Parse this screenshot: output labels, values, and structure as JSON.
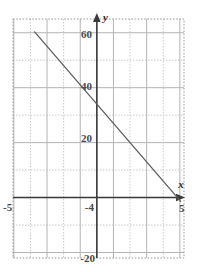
{
  "chart_data": {
    "type": "line",
    "title": "",
    "xlabel": "x",
    "ylabel": "y",
    "xlim": [
      -5.05,
      5.25
    ],
    "ylim": [
      -22,
      65
    ],
    "grid": true,
    "legend": null,
    "x_ticks": [
      {
        "value": -5,
        "label": "-5"
      },
      {
        "value": 4,
        "label": "-4"
      },
      {
        "value": 5,
        "label": "5"
      }
    ],
    "y_ticks": [
      {
        "value": 60,
        "label": "60"
      },
      {
        "value": 40,
        "label": "40"
      },
      {
        "value": 20,
        "label": "20"
      },
      {
        "value": -20,
        "label": "-20"
      }
    ],
    "x_major_step": 1,
    "y_major_step": 10,
    "series": [
      {
        "name": "line",
        "slope": -7,
        "intercept": 34,
        "points": [
          {
            "x": -3.75,
            "y": 60.3
          },
          {
            "x": 5.05,
            "y": -1.4
          }
        ]
      }
    ],
    "colors": {
      "line": "#5e5e5e",
      "axis": "#3a3a3a",
      "grid_major": "#b4b4b4",
      "grid_minor": "#c9c9c9",
      "frame": "#9a9a9a",
      "background": "#ffffff",
      "tick_text": "#4a4a4a"
    }
  },
  "axis_labels": {
    "x_axis_name": "x",
    "y_axis_name": "y"
  }
}
